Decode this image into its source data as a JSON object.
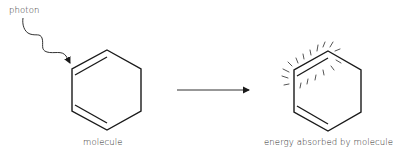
{
  "labels": {
    "photon": "photon",
    "molecule": "molecule",
    "energy_absorbed": "energy absorbed by molecule"
  },
  "diagram": {
    "nodes": [
      {
        "id": "photon",
        "label": "photon",
        "shape": "wavy-arrow"
      },
      {
        "id": "molecule",
        "label": "molecule",
        "shape": "hexagon-with-two-double-bonds"
      },
      {
        "id": "excited",
        "label": "energy absorbed by molecule",
        "shape": "hexagon-with-glow-rays"
      }
    ],
    "edges": [
      {
        "from": "photon",
        "to": "molecule",
        "style": "wavy-arrow"
      },
      {
        "from": "molecule",
        "to": "excited",
        "style": "straight-arrow"
      }
    ],
    "colors": {
      "stroke": "#1a1a1a",
      "background": "#ffffff",
      "text": "#2a2a2a"
    }
  }
}
